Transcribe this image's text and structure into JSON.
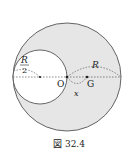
{
  "figure": {
    "caption": "図 32.4",
    "labels": {
      "big_radius": "R",
      "small_radius_num": "R",
      "small_radius_den": "2",
      "center": "O",
      "centroid": "G",
      "offset": "x"
    },
    "colors": {
      "shaded_fill": "#e6e6e6",
      "stroke": "#555555",
      "background": "#ffffff"
    }
  }
}
